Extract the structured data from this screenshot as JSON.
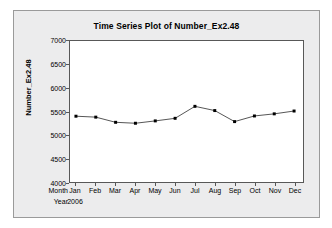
{
  "chart_data": {
    "type": "line",
    "title": "Time Series Plot of Number_Ex2.48",
    "xlabel": "",
    "ylabel": "Number_Ex2.48",
    "categories": [
      "Jan",
      "Feb",
      "Mar",
      "Apr",
      "May",
      "Jun",
      "Jul",
      "Aug",
      "Sep",
      "Oct",
      "Nov",
      "Dec"
    ],
    "values": [
      5400,
      5380,
      5270,
      5250,
      5300,
      5355,
      5610,
      5520,
      5285,
      5405,
      5450,
      5510
    ],
    "series": [
      {
        "name": "Number_Ex2.48",
        "values": [
          5400,
          5380,
          5270,
          5250,
          5300,
          5355,
          5610,
          5520,
          5285,
          5405,
          5450,
          5510
        ]
      }
    ],
    "ylim": [
      4000,
      7000
    ],
    "yticks": [
      4000,
      4500,
      5000,
      5500,
      6000,
      6500,
      7000
    ],
    "ytick_labels": [
      "4000",
      "4500",
      "5000",
      "5500",
      "6000",
      "6500",
      "7000"
    ],
    "grid": false,
    "legend": "none",
    "marker": "filled-square",
    "line_color": "#404040",
    "marker_color": "#000000",
    "plot_background": "#FFFFFF",
    "panel_background": "#ECECED"
  },
  "axis_rows": {
    "month_header": "Month",
    "year_header": "Year",
    "month_labels": [
      "Jan",
      "Feb",
      "Mar",
      "Apr",
      "May",
      "Jun",
      "Jul",
      "Aug",
      "Sep",
      "Oct",
      "Nov",
      "Dec"
    ],
    "year_labels": [
      "2006",
      "",
      "",
      "",
      "",
      "",
      "",
      "",
      "",
      "",
      "",
      ""
    ]
  }
}
